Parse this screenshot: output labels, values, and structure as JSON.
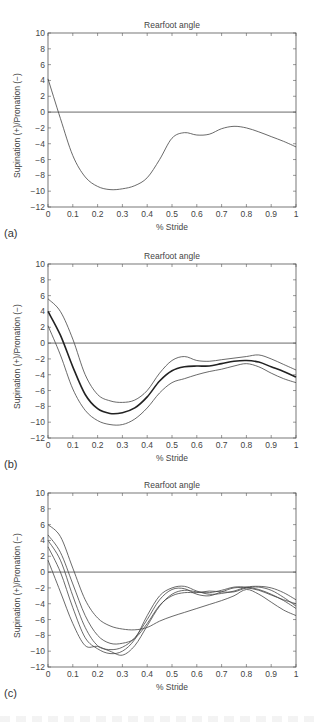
{
  "figure": {
    "panels": [
      {
        "id": "a",
        "label": "(a)",
        "title": "Rearfoot angle",
        "xlabel": "% Stride",
        "ylabel": "Supination (+)/Pronation (−)"
      },
      {
        "id": "b",
        "label": "(b)",
        "title": "Rearfoot angle",
        "xlabel": "% Stride",
        "ylabel": "Supination (+)/Pronation (−)"
      },
      {
        "id": "c",
        "label": "(c)",
        "title": "Rearfoot angle",
        "xlabel": "% Stride",
        "ylabel": "Supination (+)/Pronation (−)"
      }
    ],
    "xticks": [
      "0",
      "0.1",
      "0.2",
      "0.3",
      "0.4",
      "0.5",
      "0.6",
      "0.7",
      "0.8",
      "0.9",
      "1"
    ],
    "yticks": [
      "10",
      "8",
      "6",
      "4",
      "2",
      "0",
      "−2",
      "−4",
      "−6",
      "−8",
      "−10",
      "−12"
    ]
  },
  "chart_data": [
    {
      "type": "line",
      "title": "Rearfoot angle",
      "panel_label": "(a)",
      "xlabel": "% Stride",
      "ylabel": "Supination (+)/Pronation (−)",
      "xlim": [
        0,
        1
      ],
      "ylim": [
        -12,
        10
      ],
      "grid": false,
      "reference_line": 0,
      "x": [
        0,
        0.05,
        0.1,
        0.15,
        0.2,
        0.25,
        0.3,
        0.35,
        0.4,
        0.45,
        0.5,
        0.55,
        0.6,
        0.65,
        0.7,
        0.75,
        0.8,
        0.85,
        0.9,
        0.95,
        1
      ],
      "series": [
        {
          "name": "single stride",
          "values": [
            4.2,
            -0.8,
            -5.5,
            -8.2,
            -9.4,
            -9.8,
            -9.7,
            -9.3,
            -8.3,
            -6.0,
            -3.3,
            -2.6,
            -2.9,
            -2.8,
            -2.1,
            -1.8,
            -2.0,
            -2.5,
            -3.1,
            -3.7,
            -4.4
          ]
        }
      ]
    },
    {
      "type": "line",
      "title": "Rearfoot angle",
      "panel_label": "(b)",
      "xlabel": "% Stride",
      "ylabel": "Supination (+)/Pronation (−)",
      "xlim": [
        0,
        1
      ],
      "ylim": [
        -12,
        10
      ],
      "grid": false,
      "reference_line": 0,
      "x": [
        0,
        0.05,
        0.1,
        0.15,
        0.2,
        0.25,
        0.3,
        0.35,
        0.4,
        0.45,
        0.5,
        0.55,
        0.6,
        0.65,
        0.7,
        0.75,
        0.8,
        0.85,
        0.9,
        0.95,
        1
      ],
      "series": [
        {
          "name": "mean",
          "values": [
            4.0,
            1.0,
            -3.0,
            -6.5,
            -8.3,
            -8.9,
            -8.8,
            -8.2,
            -6.8,
            -4.8,
            -3.5,
            -3.0,
            -2.9,
            -2.9,
            -2.6,
            -2.3,
            -2.2,
            -2.4,
            -3.0,
            -3.6,
            -4.3
          ]
        },
        {
          "name": "mean + SD",
          "values": [
            5.6,
            4.0,
            0.5,
            -4.0,
            -6.5,
            -7.3,
            -7.5,
            -7.2,
            -6.0,
            -3.8,
            -2.2,
            -1.7,
            -2.2,
            -2.3,
            -2.1,
            -1.9,
            -1.7,
            -1.5,
            -2.0,
            -2.7,
            -3.4
          ]
        },
        {
          "name": "mean − SD",
          "values": [
            2.2,
            -1.5,
            -5.8,
            -8.5,
            -9.8,
            -10.3,
            -10.3,
            -9.6,
            -8.2,
            -6.3,
            -5.0,
            -4.5,
            -4.0,
            -3.6,
            -3.3,
            -2.9,
            -2.6,
            -3.0,
            -3.8,
            -4.5,
            -5.0
          ]
        }
      ]
    },
    {
      "type": "line",
      "title": "Rearfoot angle",
      "panel_label": "(c)",
      "xlabel": "% Stride",
      "ylabel": "Supination (+)/Pronation (−)",
      "xlim": [
        0,
        1
      ],
      "ylim": [
        -12,
        10
      ],
      "grid": false,
      "reference_line": 0,
      "x": [
        0,
        0.05,
        0.1,
        0.15,
        0.2,
        0.25,
        0.3,
        0.35,
        0.4,
        0.45,
        0.5,
        0.55,
        0.6,
        0.65,
        0.7,
        0.75,
        0.8,
        0.85,
        0.9,
        0.95,
        1
      ],
      "series": [
        {
          "name": "stride 1",
          "values": [
            6.0,
            4.5,
            0.5,
            -3.5,
            -5.8,
            -6.8,
            -7.2,
            -7.3,
            -7.0,
            -6.2,
            -5.6,
            -5.1,
            -4.6,
            -4.1,
            -3.6,
            -3.0,
            -2.2,
            -2.8,
            -3.8,
            -4.8,
            -5.5
          ]
        },
        {
          "name": "stride 2",
          "values": [
            4.7,
            2.5,
            -1.5,
            -5.5,
            -8.0,
            -9.0,
            -9.0,
            -8.4,
            -6.5,
            -4.2,
            -3.0,
            -2.6,
            -2.6,
            -2.4,
            -2.5,
            -2.5,
            -2.0,
            -1.9,
            -2.3,
            -3.2,
            -4.3
          ]
        },
        {
          "name": "stride 3",
          "values": [
            4.0,
            1.5,
            -3.0,
            -7.0,
            -9.3,
            -9.8,
            -9.5,
            -8.3,
            -6.0,
            -3.5,
            -2.2,
            -2.1,
            -2.8,
            -3.0,
            -2.5,
            -2.0,
            -2.0,
            -2.3,
            -2.9,
            -3.5,
            -4.0
          ]
        },
        {
          "name": "stride 4",
          "values": [
            3.2,
            0.0,
            -4.5,
            -8.3,
            -9.7,
            -10.3,
            -10.0,
            -8.5,
            -5.5,
            -3.0,
            -2.0,
            -1.8,
            -2.4,
            -2.8,
            -2.7,
            -2.4,
            -1.9,
            -1.8,
            -2.0,
            -2.6,
            -3.5
          ]
        },
        {
          "name": "stride 5",
          "values": [
            1.5,
            -2.5,
            -6.5,
            -9.3,
            -9.4,
            -10.0,
            -10.5,
            -9.3,
            -6.8,
            -4.3,
            -2.8,
            -2.3,
            -2.5,
            -2.6,
            -2.3,
            -1.9,
            -1.9,
            -2.2,
            -2.8,
            -3.6,
            -4.6
          ]
        }
      ]
    }
  ]
}
